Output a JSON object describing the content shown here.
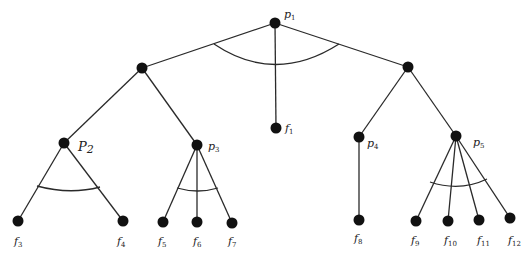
{
  "diagram": {
    "type": "and-or tree",
    "nodes": [
      {
        "id": "p1",
        "label": "p",
        "sub": "1",
        "x": 275,
        "y": 23,
        "lx": 284,
        "ly": 18
      },
      {
        "id": "n_left",
        "label": "",
        "sub": "",
        "x": 142,
        "y": 68
      },
      {
        "id": "n_right",
        "label": "",
        "sub": "",
        "x": 408,
        "y": 67
      },
      {
        "id": "f1",
        "label": "f",
        "sub": "1",
        "x": 276,
        "y": 128,
        "lx": 285,
        "ly": 132
      },
      {
        "id": "p2",
        "label": "P",
        "sub": "2",
        "x": 64,
        "y": 143,
        "lx": 78,
        "ly": 151
      },
      {
        "id": "p3",
        "label": "p",
        "sub": "3",
        "x": 197,
        "y": 145,
        "lx": 208,
        "ly": 150
      },
      {
        "id": "p4",
        "label": "p",
        "sub": "4",
        "x": 359,
        "y": 137,
        "lx": 367,
        "ly": 147
      },
      {
        "id": "p5",
        "label": "p",
        "sub": "5",
        "x": 456,
        "y": 136,
        "lx": 473,
        "ly": 146
      },
      {
        "id": "f3",
        "label": "f",
        "sub": "3",
        "x": 18,
        "y": 221,
        "lx": 14,
        "ly": 245
      },
      {
        "id": "f4",
        "label": "f",
        "sub": "4",
        "x": 123,
        "y": 221,
        "lx": 117,
        "ly": 245
      },
      {
        "id": "f5",
        "label": "f",
        "sub": "5",
        "x": 163,
        "y": 222,
        "lx": 158,
        "ly": 245
      },
      {
        "id": "f6",
        "label": "f",
        "sub": "6",
        "x": 197,
        "y": 222,
        "lx": 193,
        "ly": 245
      },
      {
        "id": "f7",
        "label": "f",
        "sub": "7",
        "x": 232,
        "y": 223,
        "lx": 228,
        "ly": 245
      },
      {
        "id": "f8",
        "label": "f",
        "sub": "8",
        "x": 359,
        "y": 220,
        "lx": 354,
        "ly": 242
      },
      {
        "id": "f9",
        "label": "f",
        "sub": "9",
        "x": 416,
        "y": 221,
        "lx": 411,
        "ly": 244
      },
      {
        "id": "f10",
        "label": "f",
        "sub": "10",
        "x": 448,
        "y": 221,
        "lx": 444,
        "ly": 244
      },
      {
        "id": "f11",
        "label": "f",
        "sub": "11",
        "x": 479,
        "y": 220,
        "lx": 477,
        "ly": 244
      },
      {
        "id": "f12",
        "label": "f",
        "sub": "12",
        "x": 510,
        "y": 218,
        "lx": 508,
        "ly": 244
      }
    ],
    "edges": [
      [
        "p1",
        "n_left"
      ],
      [
        "p1",
        "f1"
      ],
      [
        "p1",
        "n_right"
      ],
      [
        "n_left",
        "p2"
      ],
      [
        "n_left",
        "p3"
      ],
      [
        "n_right",
        "p4"
      ],
      [
        "n_right",
        "p5"
      ],
      [
        "p2",
        "f3"
      ],
      [
        "p2",
        "f4"
      ],
      [
        "p3",
        "f5"
      ],
      [
        "p3",
        "f6"
      ],
      [
        "p3",
        "f7"
      ],
      [
        "p4",
        "f8"
      ],
      [
        "p5",
        "f9"
      ],
      [
        "p5",
        "f10"
      ],
      [
        "p5",
        "f11"
      ],
      [
        "p5",
        "f12"
      ]
    ],
    "and_arcs": [
      {
        "at": "p1",
        "d": "M214,44 Q275,85 339,44"
      },
      {
        "at": "p2",
        "d": "M37,186 Q70,195 100,187"
      },
      {
        "at": "p3",
        "d": "M177,188 Q198,194 218,188"
      },
      {
        "at": "p5",
        "d": "M430,182 Q460,192 487,179"
      }
    ]
  }
}
